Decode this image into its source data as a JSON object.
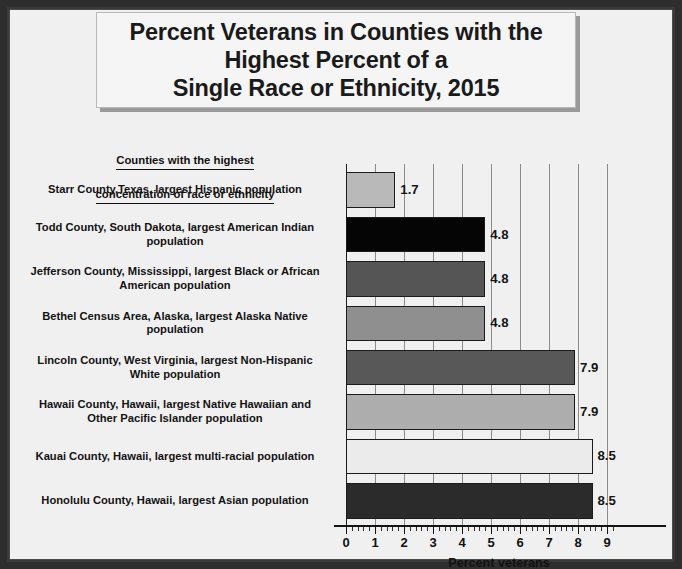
{
  "figure": {
    "title": "Percent Veterans in Counties with the\nHighest Percent of a\nSingle Race or Ethnicity, 2015",
    "legend_header_line1": "Counties with the highest",
    "legend_header_line2": "concentration of race or ethnicity",
    "frame_color": "#2e2e2e",
    "background_color": "#f1f0f0",
    "title_box_background": "#f5f5f5",
    "gridline_color": "#8b8b8b",
    "axis_color": "#141414"
  },
  "chart_data": {
    "type": "bar",
    "orientation": "horizontal",
    "title": "Percent Veterans in Counties with the Highest Percent of a Single Race or Ethnicity, 2015",
    "xlabel": "Percent veterans",
    "ylabel": "",
    "xlim": [
      0,
      9.3
    ],
    "xticks": [
      0,
      1,
      2,
      3,
      4,
      5,
      6,
      7,
      8,
      9
    ],
    "xtick_labels": [
      "0",
      "1",
      "2",
      "3",
      "4",
      "5",
      "6",
      "7",
      "8",
      "9"
    ],
    "minor_tick_interval": 0.2,
    "grid": true,
    "grid_axis": "x",
    "legend_position": "none",
    "categories": [
      "Starr County,Texas, largest Hispanic population",
      "Todd County, South Dakota, largest American Indian population",
      "Jefferson County, Mississippi, largest Black or African American population",
      "Bethel Census Area, Alaska, largest Alaska Native population",
      "Lincoln County, West Virginia, largest Non-Hispanic White population",
      "Hawaii County, Hawaii, largest Native Hawaiian and Other Pacific Islander population",
      "Kauai County, Hawaii, largest multi-racial population",
      "Honolulu County, Hawaii, largest Asian population"
    ],
    "values": [
      1.7,
      4.8,
      4.8,
      4.8,
      7.9,
      7.9,
      8.5,
      8.5
    ],
    "data_labels": [
      "1.7",
      "4.8",
      "4.8",
      "4.8",
      "7.9",
      "7.9",
      "8.5",
      "8.5"
    ],
    "bar_colors": [
      "#b9b9b9",
      "#050505",
      "#555555",
      "#8f8f8f",
      "#585858",
      "#adadad",
      "#ebebeb",
      "#2b2b2b"
    ],
    "bar_edge_color": "#1b1b1b"
  }
}
